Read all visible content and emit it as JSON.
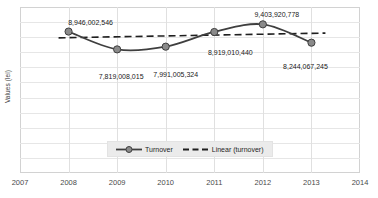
{
  "chart_data": {
    "type": "line",
    "title": "",
    "xlabel": "",
    "ylabel": "Values (lei)",
    "grid": true,
    "legend_position": "inside-bottom-center",
    "x": [
      2008,
      2009,
      2010,
      2011,
      2012,
      2013
    ],
    "xlim": [
      2007,
      2014
    ],
    "xticks": [
      "2007",
      "2008",
      "2009",
      "2010",
      "2011",
      "2012",
      "2013",
      "2014"
    ],
    "ylim": [
      0,
      10500000000
    ],
    "yticks": [],
    "series": [
      {
        "name": "Turnover",
        "type": "line",
        "smooth": true,
        "marker": "circle",
        "color": "#3f3f3f",
        "values": [
          8946002546,
          7819008015,
          7991005324,
          8919010440,
          9403920778,
          8244067245
        ],
        "labels": [
          "8,946,002,546",
          "7,819,008,015",
          "7,991,005,324",
          "8,919,010,440",
          "9,403,920,778",
          "8,244,067,245"
        ]
      },
      {
        "name": "Linear (turnover)",
        "type": "trendline",
        "style": "dashed",
        "color": "#1f1f1f",
        "values": [
          8550000000,
          8610000000,
          8670000000,
          8730000000,
          8790000000,
          8850000000
        ]
      }
    ],
    "legend": [
      "Turnover",
      "Linear (turnover)"
    ]
  },
  "colors": {
    "series_line": "#3f3f3f",
    "marker_fill": "#8a8a8a",
    "trend_line": "#1f1f1f",
    "grid": "#e6e6e6",
    "frame": "#d2d2d2",
    "legend_background": "#ebebeb",
    "text": "#1a1a1a",
    "axis_text": "#4a4a4a",
    "plot_background": "#ffffff"
  }
}
